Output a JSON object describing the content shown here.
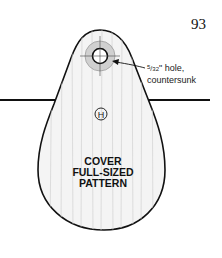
{
  "page": {
    "number": "93"
  },
  "pattern": {
    "title_lines": [
      "COVER",
      "FULL-SIZED",
      "PATTERN"
    ],
    "part_letter": "H",
    "hole_note": {
      "fraction_numerator": "5",
      "fraction_denominator": "32",
      "line1_suffix": "\" hole,",
      "line2": "countersunk"
    }
  },
  "colors": {
    "outline": "#111111",
    "wood_fill": "#f4f4f4",
    "grain": "#d8d8d8",
    "countersink": "#cfcfcf"
  }
}
